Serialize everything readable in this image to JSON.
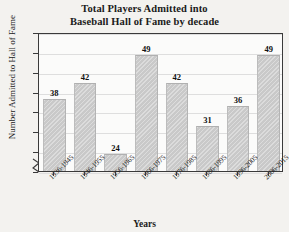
{
  "chart_data": {
    "type": "bar",
    "title": "Total Players Admitted into Baseball Hall of Fame by decade",
    "title_line1": "Total Players Admitted into",
    "title_line2": "Baseball Hall of Fame by decade",
    "xlabel": "Years",
    "ylabel": "Number Admitted to Hall of Fame",
    "categories": [
      "1936-1945",
      "1946-1955",
      "1956-1965",
      "1966-1975",
      "1976-1985",
      "1986-1995",
      "1996-2005",
      "2006-2015"
    ],
    "values": [
      38,
      42,
      24,
      49,
      42,
      31,
      36,
      49
    ],
    "ylim": [
      20,
      55
    ],
    "yticks": [
      "0",
      "20",
      "25",
      "30",
      "35",
      "40",
      "45",
      "50",
      "55"
    ],
    "axis_break": true,
    "grid": true,
    "legend": "none",
    "bar_color": "#c9c9c9",
    "frame_color": "#3a3a3a",
    "gridline_color": "#dedede",
    "background": "#f3f2ef"
  }
}
